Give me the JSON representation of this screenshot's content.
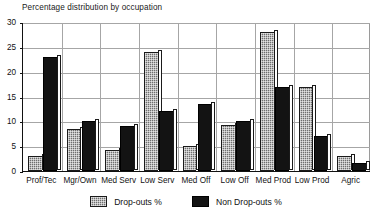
{
  "chart_data": {
    "type": "bar",
    "title": "Percentage distribution by occupation",
    "xlabel": "",
    "ylabel": "",
    "ylim": [
      0,
      30
    ],
    "yticks": [
      0,
      5,
      10,
      15,
      20,
      25,
      30
    ],
    "grid": true,
    "legend_position": "bottom",
    "categories": [
      "Prof/Tec",
      "Mgr/Own",
      "Med Serv",
      "Low Serv",
      "Med Off",
      "Low Off",
      "Med Prod",
      "Low Prod",
      "Agric"
    ],
    "series": [
      {
        "name": "Drop-outs %",
        "color": "#6f6f6f",
        "pattern": "checkered",
        "values": [
          3.0,
          8.5,
          4.2,
          24.0,
          5.0,
          9.2,
          28.0,
          17.0,
          3.0
        ]
      },
      {
        "name": "Non Drop-outs %",
        "color": "#131313",
        "pattern": "solid",
        "values": [
          23.0,
          10.0,
          9.0,
          12.0,
          13.5,
          10.0,
          17.0,
          7.0,
          1.7
        ]
      }
    ]
  }
}
